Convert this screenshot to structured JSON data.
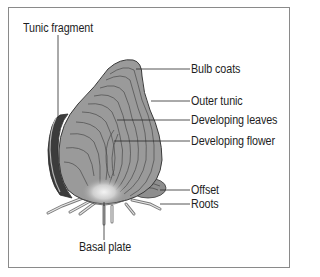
{
  "diagram": {
    "labels": {
      "tunic_fragment": "Tunic fragment",
      "bulb_coats": "Bulb coats",
      "outer_tunic": "Outer tunic",
      "developing_leaves": "Developing leaves",
      "developing_flower": "Developing flower",
      "offset": "Offset",
      "roots": "Roots",
      "basal_plate": "Basal plate"
    },
    "colors": {
      "bulb_fill": "#9a9a9a",
      "bulb_outline": "#3a3a3a",
      "tunic_dark": "#3c3c3c",
      "frame": "#8a8a8a",
      "leader_line": "#2a2a2a"
    }
  }
}
